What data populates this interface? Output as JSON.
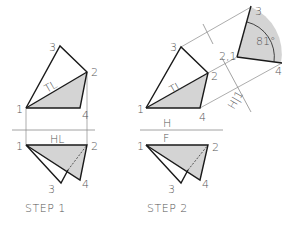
{
  "figure": {
    "colors": {
      "background": "#ffffff",
      "thick_line": "#1a1a1a",
      "thin_line": "#8a8a8a",
      "fill": "#d4d4d4",
      "text": "#555555"
    },
    "step1": {
      "caption": "STEP 1",
      "top_view": {
        "points": {
          "p1": "1",
          "p2": "2",
          "p3": "3",
          "p4": "4"
        },
        "tl_label": "TL"
      },
      "fold_label": "HL",
      "front_view": {
        "points": {
          "p1": "1",
          "p2": "2",
          "p3": "3",
          "p4": "4"
        }
      }
    },
    "step2": {
      "caption": "STEP 2",
      "top_view": {
        "points": {
          "p1": "1",
          "p2": "2",
          "p3": "3",
          "p4": "4"
        },
        "tl_label": "TL"
      },
      "fold_label_top": "H",
      "fold_label_bottom": "F",
      "front_view": {
        "points": {
          "p1": "1",
          "p2": "2",
          "p3": "3",
          "p4": "4"
        }
      },
      "aux_fold_label": "H|1",
      "aux_view": {
        "points": {
          "p21": "2,1",
          "p3": "3",
          "p4": "4"
        },
        "angle": "81°"
      }
    }
  }
}
